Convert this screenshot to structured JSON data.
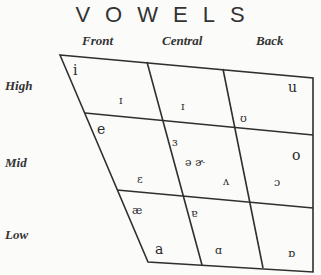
{
  "title": "VOWELS",
  "columns": {
    "front": "Front",
    "central": "Central",
    "back": "Back"
  },
  "rows": {
    "high": "High",
    "mid": "Mid",
    "low": "Low"
  },
  "symbols": {
    "i": "i",
    "small_i_front": "ɪ",
    "small_i_central": "ɪ",
    "upsilon": "ʊ",
    "u": "u",
    "e": "e",
    "reversed_epsilon": "ɜ",
    "schwa_pair": "ə ɚ",
    "o": "o",
    "epsilon": "ɛ",
    "wedge": "ʌ",
    "open_o": "ɔ",
    "ae": "æ",
    "turned_a": "ɐ",
    "a": "a",
    "script_a": "ɑ",
    "turned_script_a": "ɒ"
  },
  "colors": {
    "line": "#2f2f2f",
    "background": "#fbfbfa",
    "text": "#2a2a2a"
  }
}
